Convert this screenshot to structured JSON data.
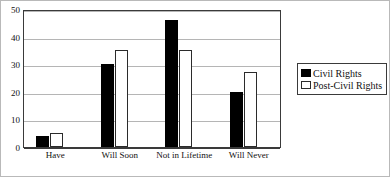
{
  "chart_data": {
    "type": "bar",
    "title": "",
    "xlabel": "",
    "ylabel": "",
    "categories": [
      "Have",
      "Will Soon",
      "Not in Lifetime",
      "Will Never"
    ],
    "series": [
      {
        "name": "Civil Rights",
        "values": [
          4,
          30,
          46,
          20
        ],
        "color": "#000000"
      },
      {
        "name": "Post-Civil Rights",
        "values": [
          5,
          35,
          35,
          27
        ],
        "color": "#ffffff"
      }
    ],
    "ylim": [
      0,
      50
    ],
    "yticks": [
      0,
      10,
      20,
      30,
      40,
      50
    ],
    "ytick_labels": [
      "0",
      "10",
      "20",
      "30",
      "40",
      "50"
    ],
    "grid": true,
    "legend_position": "right"
  }
}
